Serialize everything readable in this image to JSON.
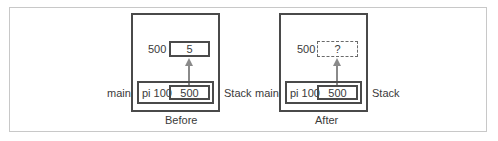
{
  "diagrams": [
    {
      "caption": "Before",
      "heap_address": "500",
      "heap_value": "5",
      "heap_value_style": "solid",
      "frame_label": "main",
      "variable": "pi 100",
      "variable_value": "500",
      "region_label": "Stack"
    },
    {
      "caption": "After",
      "heap_address": "500",
      "heap_value": "?",
      "heap_value_style": "dashed",
      "frame_label": "main",
      "variable": "pi 100",
      "variable_value": "500",
      "region_label": "Stack"
    }
  ],
  "colors": {
    "border": "#4a4a4a",
    "arrow": "#8a8a8a",
    "outer_frame": "#c8c8c8",
    "text": "#3a3a3a"
  }
}
